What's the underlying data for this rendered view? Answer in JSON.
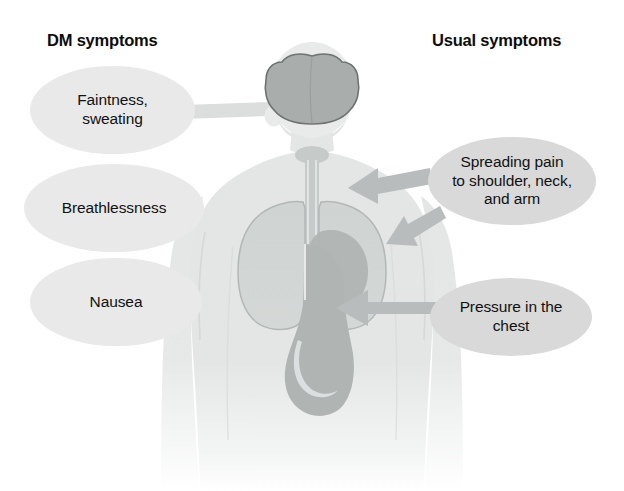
{
  "diagram": {
    "title_left": "DM symptoms",
    "title_right": "Usual symptoms",
    "colors": {
      "body_fill": "#e4e6e6",
      "organ_fill": "#c6cac9",
      "organ_dark": "#a9adac",
      "brain_fill": "#a9adac",
      "callout_left_fill": "#e9e9e9",
      "callout_right_fill": "#d9d9d9",
      "arrow_fill": "#b9bcbc",
      "connector_fill": "#dcdedd",
      "text": "#111111"
    },
    "left_callouts": [
      {
        "id": "faintness",
        "lines": [
          "Faintness,",
          "sweating"
        ],
        "target": "brain"
      },
      {
        "id": "breathless",
        "lines": [
          "Breathlessness"
        ],
        "target": "lungs"
      },
      {
        "id": "nausea",
        "lines": [
          "Nausea"
        ],
        "target": "stomach"
      }
    ],
    "right_callouts": [
      {
        "id": "spreading",
        "lines": [
          "Spreading pain",
          "to shoulder, neck,",
          "and arm"
        ],
        "target": "shoulder-and-heart"
      },
      {
        "id": "pressure",
        "lines": [
          "Pressure in the",
          "chest"
        ],
        "target": "heart"
      }
    ],
    "anatomy_parts": [
      "head",
      "brain",
      "neck",
      "trachea",
      "left-lung",
      "right-lung",
      "heart",
      "esophagus",
      "stomach",
      "torso",
      "arms"
    ]
  }
}
